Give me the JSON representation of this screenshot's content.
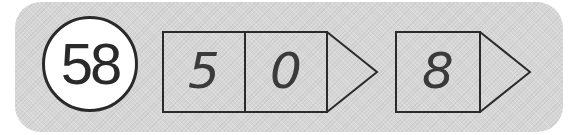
{
  "problem": {
    "number": "58"
  },
  "groups": [
    {
      "cells": [
        "5",
        "0"
      ]
    },
    {
      "cells": [
        "8"
      ]
    }
  ],
  "colors": {
    "panel": "#d6d6d6",
    "stroke": "#2a2a2a",
    "badge_fill": "#ffffff"
  }
}
